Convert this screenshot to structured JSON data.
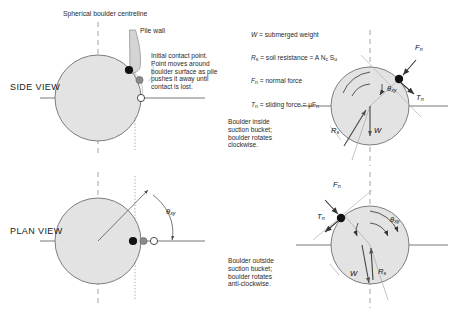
{
  "figure": {
    "title_left_top": "Spherical boulder centreline",
    "pile_wall_label": "Pile wall",
    "views": {
      "side": "SIDE VIEW",
      "plan": "PLAN VIEW"
    },
    "contact_note": "Initial contact point.\nPoint moves around\nboulder surface as pile\npushes it away until\ncontact is lost."
  },
  "legend": {
    "lines": [
      {
        "sym": "W",
        "sub": "",
        "text": " = submerged weight"
      },
      {
        "sym": "R",
        "sub": "s",
        "text": " = soil resistance = A N",
        "sub2": "c",
        "text2": " S",
        "sub3": "u"
      },
      {
        "sym": "F",
        "sub": "n",
        "text": " = normal force"
      },
      {
        "sym": "T",
        "sub": "n",
        "text": " = sliding force = μF",
        "sub2": "n"
      }
    ]
  },
  "panels": {
    "inside": {
      "caption": "Boulder inside\nsuction bucket;\nboulder rotates\nclockwise.",
      "labels": {
        "fn": "F",
        "fn_sub": "n",
        "tn": "T",
        "tn_sub": "n",
        "theta": "θ",
        "theta_sub": "xy",
        "rs": "R",
        "rs_sub": "s",
        "w": "W"
      }
    },
    "outside": {
      "caption": "Boulder outside\nsuction bucket;\nboulder rotates\nanti-clockwise.",
      "labels": {
        "fn": "F",
        "fn_sub": "n",
        "tn": "T",
        "tn_sub": "n",
        "theta": "θ",
        "theta_sub": "xy",
        "rs": "R",
        "rs_sub": "s",
        "w": "W"
      }
    },
    "plan": {
      "theta": "θ",
      "theta_sub": "xy"
    }
  },
  "colors": {
    "boulder_fill": "#e3e3e3",
    "boulder_stroke": "#6f6f6f",
    "axis": "#555555",
    "dashed": "#9a9a9a",
    "dotted": "#8c8c8c",
    "contact_dot": "#111111",
    "mid_dot": "#8a8a8a",
    "end_dot": "#ffffff",
    "pile_fill": "#d4d4d4",
    "arrow": "#333333",
    "text": "#2a2a2a"
  }
}
